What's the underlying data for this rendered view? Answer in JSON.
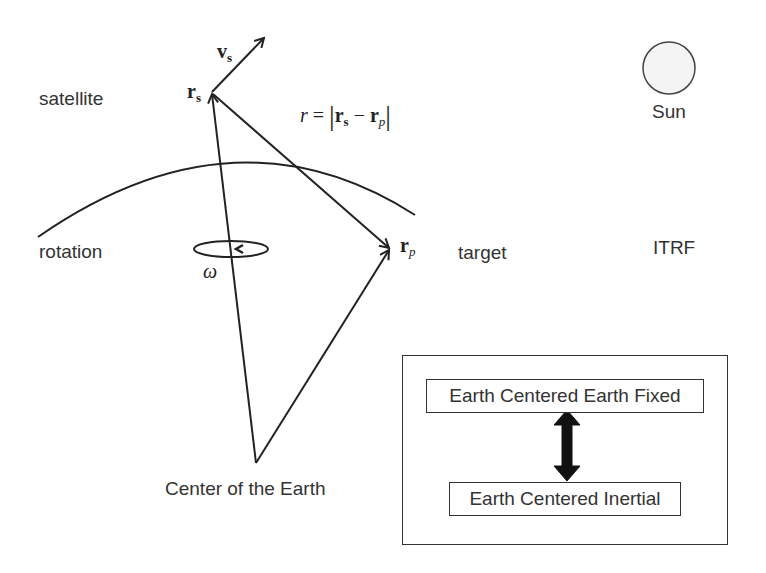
{
  "labels": {
    "satellite": "satellite",
    "rotation": "rotation",
    "target": "target",
    "sun": "Sun",
    "itrf": "ITRF",
    "center": "Center of the Earth"
  },
  "symbols": {
    "vs_main": "v",
    "vs_sub": "s",
    "rs_main": "r",
    "rs_sub": "s",
    "rp_main": "r",
    "rp_sub": "p",
    "omega": "ω",
    "range_eq_lhs": "r",
    "range_eq_eq": " = ",
    "range_eq_r1": "r",
    "range_eq_r1_sub": "s",
    "range_eq_minus": " − ",
    "range_eq_r2": "r",
    "range_eq_r2_sub": "p"
  },
  "frames_box": {
    "top": "Earth Centered Earth Fixed",
    "bottom": "Earth Centered Inertial"
  },
  "colors": {
    "line": "#222222",
    "sun_fill": "#f4f4f4",
    "text": "#333333"
  }
}
